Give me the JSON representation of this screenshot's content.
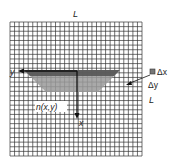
{
  "diagram": {
    "grid_cells_x": 29,
    "grid_cells_y": 29,
    "labels": {
      "top_L": "L",
      "side_L": "L",
      "y_axis": "y",
      "x_axis": "x",
      "n_xy": "n(x,y)",
      "delta_x": "Δx",
      "delta_y": "Δy"
    },
    "colors": {
      "grid": "#333333",
      "shade_dark": "#555555",
      "shade_light": "#9a9a9a",
      "axis": "#111111"
    }
  }
}
